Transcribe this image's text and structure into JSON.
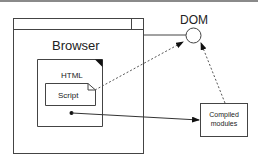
{
  "diagram": {
    "browser": {
      "label": "Browser"
    },
    "html_doc": {
      "label": "HTML"
    },
    "script": {
      "label": "Script"
    },
    "dom": {
      "label": "DOM"
    },
    "compiled": {
      "line1": "Compiled",
      "line2": "modules"
    },
    "colors": {
      "stroke": "#444444",
      "text": "#222222",
      "background": "#ffffff"
    }
  }
}
